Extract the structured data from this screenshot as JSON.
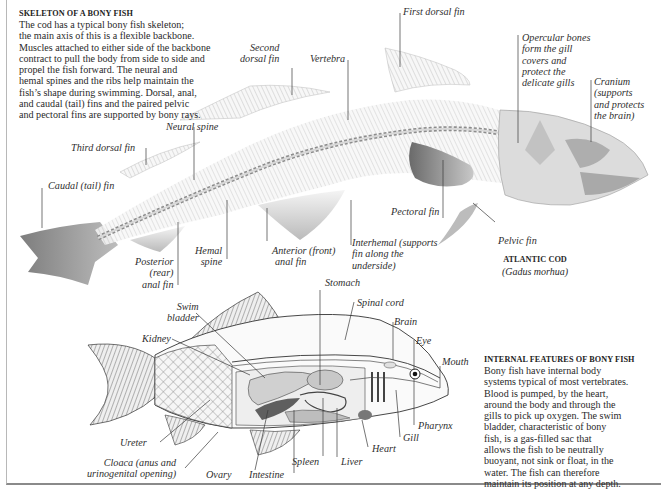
{
  "skeleton_section": {
    "heading": "SKELETON OF  A BONY FISH",
    "body_lines": [
      "The cod has a typical bony fish skeleton;",
      "the main axis of this is a flexible backbone.",
      "Muscles attached to either side of the backbone",
      "contract to pull the body from side to side and",
      "propel the fish forward. The neural and",
      "hemal spines and the ribs help maintain the",
      "fish’s shape during swimming. Dorsal, anal,",
      "and caudal (tail) fins and the paired pelvic",
      "and pectoral fins are supported by bony rays."
    ],
    "labels": {
      "first_dorsal_fin": "First dorsal  fin",
      "second_dorsal_fin": [
        "Second",
        "dorsal fin"
      ],
      "vertebra": "Vertebra",
      "opercular_bones": [
        "Opercular bones",
        "form the gill",
        "covers and",
        "protect the",
        "delicate gills"
      ],
      "cranium": [
        "Cranium",
        "(supports",
        "and protects",
        "the brain)"
      ],
      "neural_spine": "Neural spine",
      "third_dorsal_fin": "Third dorsal fin",
      "caudal_fin": "Caudal (tail) fin",
      "pectoral_fin": "Pectoral fin",
      "pelvic_fin": "Pelvic fin",
      "interhemal": [
        "Interhemal (supports",
        "fin along the",
        "underside)"
      ],
      "anterior_anal_fin": [
        "Anterior (front)",
        "anal fin"
      ],
      "hemal_spine": [
        "Hemal",
        "spine"
      ],
      "posterior_anal_fin": [
        "Posterior",
        "(rear)",
        "anal fin"
      ]
    },
    "caption": {
      "title": "ATLANTIC COD",
      "scientific_name": "(Gadus morhua)"
    }
  },
  "internal_section": {
    "heading": "INTERNAL FEATURES OF  BONY FISH",
    "body_lines": [
      "Bony fish have internal body",
      "systems typical of most vertebrates.",
      "Blood is pumped, by the heart,",
      "around the body and through the",
      "gills to pick up oxygen. The swim",
      "bladder, characteristic of bony",
      "fish, is a gas-filled sac that",
      "allows the fish to be neutrally",
      "buoyant, not sink or float, in the",
      "water. The fish can therefore",
      "maintain its position at any depth."
    ],
    "labels": {
      "stomach": "Stomach",
      "spinal_cord": "Spinal cord",
      "brain": "Brain",
      "eye": "Eye",
      "mouth": "Mouth",
      "swim_bladder": [
        "Swim",
        "bladder"
      ],
      "kidney": "Kidney",
      "pharynx": "Pharynx",
      "gill": "Gill",
      "heart": "Heart",
      "liver": "Liver",
      "spleen": "Spleen",
      "intestine": "Intestine",
      "ovary": "Ovary",
      "cloaca": [
        "Cloaca (anus and",
        "urinogenital opening)"
      ],
      "ureter": "Ureter"
    }
  },
  "colors": {
    "text": "#2a2a2a",
    "leader_line": "#3a3a3a",
    "bone_light": "#e6e6e6",
    "bone_mid": "#bdbdbd",
    "fin_dark": "#7d7d7d",
    "border": "#8a8a8a"
  }
}
